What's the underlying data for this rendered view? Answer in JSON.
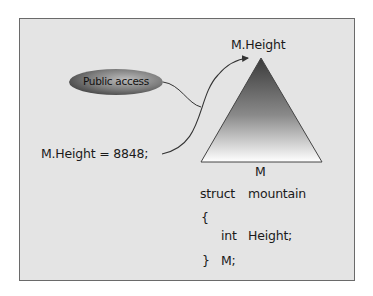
{
  "diagram": {
    "title_label": "M.Height",
    "assignment": "M.Height = 8848;",
    "callout": "Public access",
    "object_label": "M",
    "code": {
      "line1_keyword": "struct",
      "line1_name": "mountain",
      "open_brace": "{",
      "member_type": "int",
      "member_name": "Height;",
      "close_brace": "}",
      "instance": "M;"
    },
    "colors": {
      "panel_bg": "#e4e4e4",
      "border": "#6a6a6a",
      "ellipse_dark": "#3e3e3e",
      "ellipse_light": "#b8b8b8",
      "triangle_top": "#3a3a3a",
      "triangle_bottom": "#ffffff"
    }
  }
}
